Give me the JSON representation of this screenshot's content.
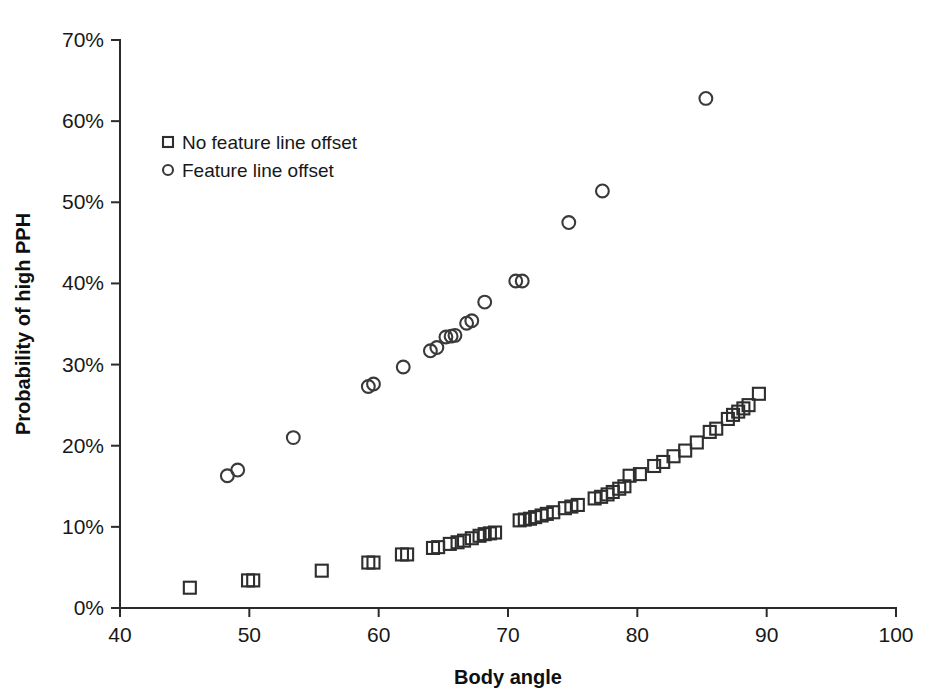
{
  "chart_data": {
    "type": "scatter",
    "title": "",
    "xlabel": "Body angle",
    "ylabel": "Probability of high PPH",
    "xlim": [
      40,
      100
    ],
    "ylim": [
      0,
      70
    ],
    "xticks": [
      40,
      50,
      60,
      70,
      80,
      90,
      100
    ],
    "xtick_labels": [
      "40",
      "50",
      "60",
      "70",
      "80",
      "90",
      "100"
    ],
    "yticks": [
      0,
      10,
      20,
      30,
      40,
      50,
      60,
      70
    ],
    "ytick_labels": [
      "0%",
      "10%",
      "20%",
      "30%",
      "40%",
      "50%",
      "60%",
      "70%"
    ],
    "grid": false,
    "legend_position": "upper-left-inside",
    "y_units": "percent",
    "series": [
      {
        "name": "No feature line offset",
        "marker": "square",
        "color": "#2e2e2e",
        "points": [
          [
            45.4,
            2.5
          ],
          [
            49.9,
            3.4
          ],
          [
            50.3,
            3.4
          ],
          [
            55.6,
            4.6
          ],
          [
            59.2,
            5.6
          ],
          [
            59.6,
            5.6
          ],
          [
            61.8,
            6.6
          ],
          [
            62.2,
            6.6
          ],
          [
            64.2,
            7.4
          ],
          [
            64.6,
            7.5
          ],
          [
            65.5,
            7.9
          ],
          [
            66.1,
            8.1
          ],
          [
            66.6,
            8.3
          ],
          [
            67.2,
            8.6
          ],
          [
            67.8,
            8.9
          ],
          [
            68.2,
            9.1
          ],
          [
            68.6,
            9.2
          ],
          [
            69.0,
            9.3
          ],
          [
            70.9,
            10.8
          ],
          [
            71.3,
            10.9
          ],
          [
            71.7,
            11.0
          ],
          [
            72.1,
            11.2
          ],
          [
            72.6,
            11.4
          ],
          [
            73.0,
            11.6
          ],
          [
            73.5,
            11.8
          ],
          [
            74.4,
            12.3
          ],
          [
            74.9,
            12.5
          ],
          [
            75.4,
            12.7
          ],
          [
            76.7,
            13.5
          ],
          [
            77.2,
            13.7
          ],
          [
            77.7,
            14.0
          ],
          [
            78.1,
            14.3
          ],
          [
            78.6,
            14.7
          ],
          [
            79.0,
            15.0
          ],
          [
            79.4,
            16.3
          ],
          [
            80.2,
            16.5
          ],
          [
            81.3,
            17.5
          ],
          [
            82.0,
            18.0
          ],
          [
            82.8,
            18.7
          ],
          [
            83.7,
            19.4
          ],
          [
            84.6,
            20.4
          ],
          [
            85.6,
            21.7
          ],
          [
            86.1,
            22.1
          ],
          [
            87.0,
            23.3
          ],
          [
            87.4,
            23.8
          ],
          [
            87.8,
            24.2
          ],
          [
            88.2,
            24.6
          ],
          [
            88.6,
            25.0
          ],
          [
            89.4,
            26.4
          ]
        ]
      },
      {
        "name": "Feature line offset",
        "marker": "circle",
        "color": "#3a3a3a",
        "points": [
          [
            48.3,
            16.3
          ],
          [
            49.1,
            17.0
          ],
          [
            53.4,
            21.0
          ],
          [
            59.2,
            27.3
          ],
          [
            59.6,
            27.6
          ],
          [
            61.9,
            29.7
          ],
          [
            64.0,
            31.7
          ],
          [
            64.5,
            32.1
          ],
          [
            65.2,
            33.4
          ],
          [
            65.6,
            33.5
          ],
          [
            65.9,
            33.6
          ],
          [
            66.8,
            35.1
          ],
          [
            67.2,
            35.4
          ],
          [
            68.2,
            37.7
          ],
          [
            70.6,
            40.3
          ],
          [
            71.1,
            40.3
          ],
          [
            74.7,
            47.5
          ],
          [
            77.3,
            51.4
          ],
          [
            85.3,
            62.8
          ]
        ]
      }
    ]
  },
  "legend": {
    "entries": [
      {
        "label": "No feature line offset",
        "marker": "square"
      },
      {
        "label": "Feature line offset",
        "marker": "circle"
      }
    ]
  },
  "axes": {
    "x_title": "Body angle",
    "y_title": "Probability of high PPH"
  }
}
